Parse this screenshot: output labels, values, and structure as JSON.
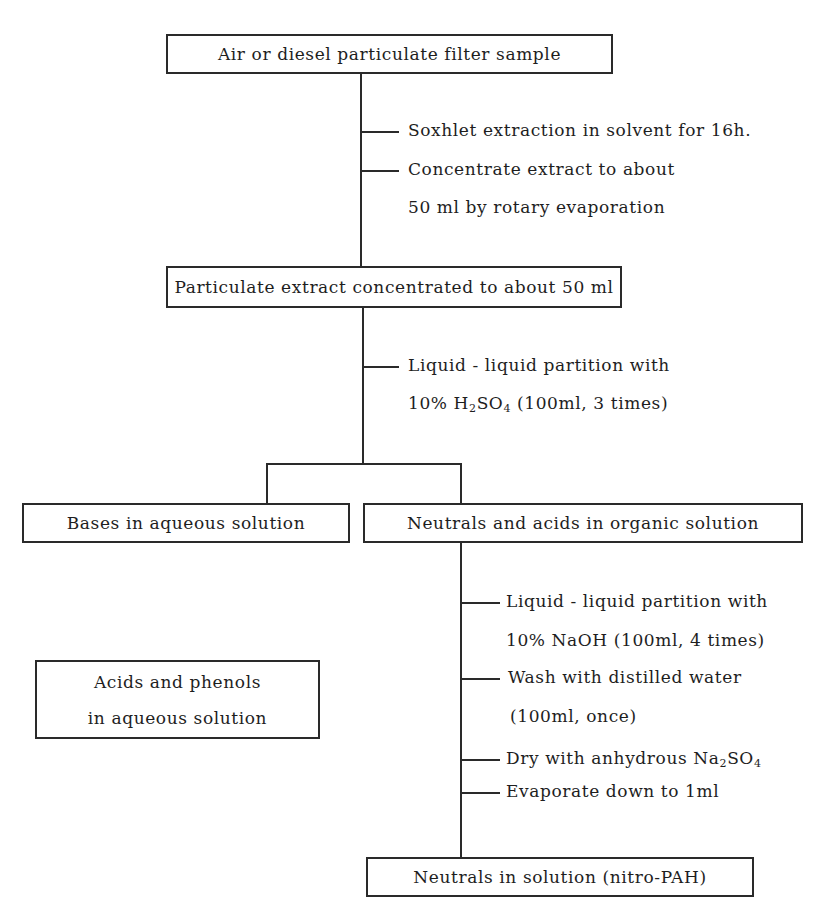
{
  "diagram": {
    "nodes": {
      "filter_sample": "Air or diesel particulate filter sample",
      "extract_concentrated": "Particulate extract concentrated to about 50 ml",
      "bases_aqueous": "Bases in aqueous solution",
      "neutrals_acids_organic": "Neutrals and acids in organic solution",
      "acids_phenols": [
        "Acids and phenols",
        "in aqueous solution"
      ],
      "neutrals_final": "Neutrals in solution (nitro-PAH)"
    },
    "steps": {
      "stage1": [
        {
          "text": "Soxhlet extraction in solvent for 16h."
        },
        {
          "text": "Concentrate extract to about",
          "continuation": "50 ml by rotary evaporation"
        }
      ],
      "stage2": [
        {
          "text": "Liquid - liquid partition with",
          "continuation_pre": "10% H",
          "sub1": "2",
          "mid": "SO",
          "sub2": "4",
          "continuation_post": "(100ml, 3 times)"
        }
      ],
      "stage3": [
        {
          "text": "Liquid - liquid partition with",
          "continuation": "10% NaOH (100ml, 4 times)"
        },
        {
          "text": "Wash with distilled water",
          "continuation": "(100ml, once)"
        },
        {
          "text_pre": "Dry with anhydrous Na",
          "sub1": "2",
          "mid": "SO",
          "sub2": "4"
        },
        {
          "text": "Evaporate down to 1ml"
        }
      ]
    }
  }
}
